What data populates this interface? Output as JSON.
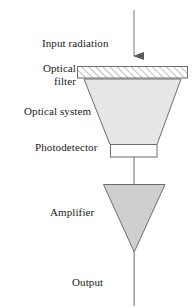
{
  "diagram": {
    "background_color": "#ffffff",
    "stroke_color": "#555555",
    "text_color": "#1a1a1a",
    "labels": {
      "input_radiation": "Input radiation",
      "optical_filter_line1": "Optical",
      "optical_filter_line2": "filter",
      "optical_system": "Optical system",
      "photodetector": "Photodetector",
      "amplifier": "Amplifier",
      "output": "Output"
    },
    "blocks": [
      {
        "name": "optical-filter",
        "shape": "rectangle",
        "fill": "#ffffff",
        "pattern": "diagonal-hatch",
        "x": 77,
        "y": 66,
        "width": 111,
        "height": 12
      },
      {
        "name": "optical-system",
        "shape": "trapezoid",
        "fill": "#e3e3e3",
        "top_left_x": 84,
        "top_right_x": 181,
        "top_y": 79,
        "bottom_left_x": 110,
        "bottom_right_x": 157,
        "bottom_y": 144
      },
      {
        "name": "photodetector",
        "shape": "rectangle",
        "fill": "#ffffff",
        "x": 110,
        "y": 144,
        "width": 47,
        "height": 13
      },
      {
        "name": "amplifier",
        "shape": "triangle-down",
        "fill": "#cfcfcf",
        "top_left_x": 103,
        "top_right_x": 165,
        "top_y": 184,
        "apex_x": 134,
        "apex_y": 252
      }
    ],
    "connectors": [
      {
        "name": "input-arrow",
        "x": 134,
        "from_y": 10,
        "to_y": 64,
        "arrowhead": "down"
      },
      {
        "name": "photodetector-to-amplifier",
        "x": 134,
        "from_y": 157,
        "to_y": 184,
        "arrowhead": "none"
      },
      {
        "name": "output-line",
        "x": 134,
        "from_y": 252,
        "to_y": 305,
        "arrowhead": "none"
      }
    ]
  }
}
